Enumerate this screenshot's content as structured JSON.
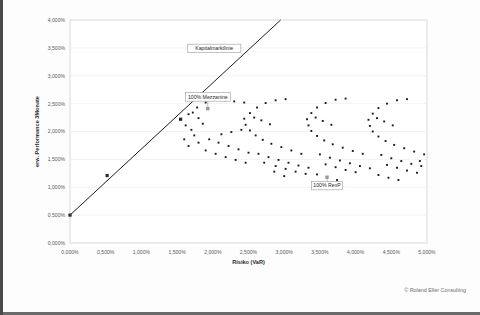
{
  "footer": {
    "copyright": "© Roland Eller Consulting"
  },
  "chart_data": {
    "type": "scatter",
    "title": "",
    "xlabel": "Risiko (VaR)",
    "ylabel": "erw. Performance 3Monate",
    "xlim": [
      0,
      5
    ],
    "ylim": [
      0,
      4
    ],
    "unit": "%",
    "grid": true,
    "legend": "none",
    "xticks": [
      "0,000%",
      "0,500%",
      "1,000%",
      "1,500%",
      "2,000%",
      "2,500%",
      "3,000%",
      "3,500%",
      "4,000%",
      "4,500%",
      "5,000%"
    ],
    "xtick_values": [
      0,
      0.5,
      1.0,
      1.5,
      2.0,
      2.5,
      3.0,
      3.5,
      4.0,
      4.5,
      5.0
    ],
    "yticks": [
      "0,000%",
      "0,500%",
      "1,000%",
      "1,500%",
      "2,000%",
      "2,500%",
      "3,000%",
      "3,500%",
      "4,000%"
    ],
    "ytick_values": [
      0,
      0.5,
      1.0,
      1.5,
      2.0,
      2.5,
      3.0,
      3.5,
      4.0
    ],
    "annotations": [
      {
        "label": "Kapitalmarktlinie",
        "anchor_x": 2.3,
        "anchor_y": 3.52,
        "box_x": 2.02,
        "box_y": 3.49
      },
      {
        "label": "100% Mezzanine",
        "anchor_x": 1.93,
        "anchor_y": 2.41,
        "box_x": 1.93,
        "box_y": 2.62
      },
      {
        "label": "100% RexP",
        "anchor_x": 3.6,
        "anchor_y": 1.18,
        "box_x": 3.6,
        "box_y": 1.03
      }
    ],
    "series": [
      {
        "name": "Kapitalmarktlinie",
        "type": "line",
        "points": [
          [
            0.0,
            0.5
          ],
          [
            2.95,
            4.0
          ]
        ],
        "markers": [
          [
            0.0,
            0.5
          ],
          [
            0.52,
            1.21
          ],
          [
            1.55,
            2.22
          ]
        ]
      },
      {
        "name": "Portfoliowolke 1",
        "type": "scatter",
        "points": [
          [
            1.54,
            2.22
          ],
          [
            1.66,
            2.31
          ],
          [
            1.62,
            2.11
          ],
          [
            1.7,
            2.03
          ],
          [
            1.74,
            1.93
          ],
          [
            1.6,
            1.86
          ],
          [
            1.78,
            2.43
          ],
          [
            1.9,
            2.52
          ],
          [
            2.03,
            2.57
          ],
          [
            2.17,
            2.56
          ],
          [
            2.3,
            2.54
          ],
          [
            2.44,
            2.52
          ],
          [
            1.72,
            2.34
          ],
          [
            1.8,
            2.24
          ],
          [
            1.86,
            2.14
          ],
          [
            1.66,
            1.74
          ],
          [
            1.8,
            1.8
          ],
          [
            1.95,
            1.86
          ],
          [
            2.08,
            1.8
          ],
          [
            2.22,
            1.74
          ],
          [
            2.36,
            1.68
          ],
          [
            2.5,
            1.62
          ],
          [
            2.12,
            1.95
          ],
          [
            2.26,
            1.99
          ],
          [
            2.4,
            2.03
          ],
          [
            1.9,
            1.66
          ],
          [
            2.04,
            1.6
          ],
          [
            2.18,
            1.54
          ],
          [
            2.32,
            1.49
          ],
          [
            2.46,
            1.44
          ]
        ]
      },
      {
        "name": "Portfoliowolke 2",
        "type": "scatter",
        "points": [
          [
            2.44,
            2.23
          ],
          [
            2.52,
            2.33
          ],
          [
            2.62,
            2.43
          ],
          [
            2.74,
            2.51
          ],
          [
            2.88,
            2.56
          ],
          [
            3.02,
            2.58
          ],
          [
            2.46,
            2.12
          ],
          [
            2.52,
            2.02
          ],
          [
            2.6,
            1.93
          ],
          [
            2.7,
            1.85
          ],
          [
            2.82,
            1.78
          ],
          [
            2.96,
            1.72
          ],
          [
            3.1,
            1.66
          ],
          [
            3.24,
            1.6
          ],
          [
            2.58,
            2.25
          ],
          [
            2.68,
            2.2
          ],
          [
            2.8,
            2.13
          ],
          [
            2.64,
            1.6
          ],
          [
            2.78,
            1.54
          ],
          [
            2.92,
            1.49
          ],
          [
            3.06,
            1.44
          ],
          [
            3.2,
            1.39
          ],
          [
            3.34,
            1.35
          ],
          [
            2.88,
            1.38
          ],
          [
            3.02,
            1.33
          ],
          [
            3.16,
            1.28
          ],
          [
            3.3,
            1.24
          ],
          [
            2.72,
            1.44
          ],
          [
            2.86,
            1.28
          ],
          [
            3.0,
            1.2
          ]
        ]
      },
      {
        "name": "Portfoliowolke 3",
        "type": "scatter",
        "points": [
          [
            3.32,
            2.22
          ],
          [
            3.38,
            2.33
          ],
          [
            3.46,
            2.43
          ],
          [
            3.58,
            2.51
          ],
          [
            3.72,
            2.57
          ],
          [
            3.86,
            2.59
          ],
          [
            3.34,
            2.11
          ],
          [
            3.38,
            2.01
          ],
          [
            3.46,
            1.92
          ],
          [
            3.56,
            1.84
          ],
          [
            3.68,
            1.77
          ],
          [
            3.82,
            1.71
          ],
          [
            3.96,
            1.65
          ],
          [
            4.1,
            1.6
          ],
          [
            3.44,
            2.25
          ],
          [
            3.54,
            2.19
          ],
          [
            3.66,
            2.12
          ],
          [
            3.5,
            1.59
          ],
          [
            3.64,
            1.53
          ],
          [
            3.78,
            1.48
          ],
          [
            3.92,
            1.43
          ],
          [
            4.06,
            1.38
          ],
          [
            4.2,
            1.34
          ],
          [
            3.72,
            1.36
          ],
          [
            3.86,
            1.31
          ],
          [
            4.0,
            1.27
          ],
          [
            3.58,
            1.41
          ],
          [
            3.46,
            1.23
          ],
          [
            3.6,
            1.18
          ],
          [
            3.74,
            1.13
          ]
        ]
      },
      {
        "name": "Portfoliowolke 4",
        "type": "scatter",
        "points": [
          [
            4.18,
            2.21
          ],
          [
            4.24,
            2.32
          ],
          [
            4.32,
            2.42
          ],
          [
            4.44,
            2.5
          ],
          [
            4.58,
            2.56
          ],
          [
            4.72,
            2.58
          ],
          [
            4.2,
            2.1
          ],
          [
            4.24,
            2.0
          ],
          [
            4.32,
            1.91
          ],
          [
            4.42,
            1.83
          ],
          [
            4.54,
            1.76
          ],
          [
            4.68,
            1.7
          ],
          [
            4.82,
            1.64
          ],
          [
            4.96,
            1.59
          ],
          [
            4.3,
            2.24
          ],
          [
            4.4,
            2.18
          ],
          [
            4.52,
            2.11
          ],
          [
            4.36,
            1.58
          ],
          [
            4.5,
            1.52
          ],
          [
            4.64,
            1.47
          ],
          [
            4.78,
            1.42
          ],
          [
            4.92,
            1.38
          ],
          [
            4.58,
            1.35
          ],
          [
            4.72,
            1.3
          ],
          [
            4.86,
            1.26
          ],
          [
            4.44,
            1.4
          ],
          [
            4.32,
            1.22
          ],
          [
            4.46,
            1.17
          ],
          [
            4.6,
            1.13
          ],
          [
            4.9,
            1.47
          ]
        ]
      }
    ]
  }
}
